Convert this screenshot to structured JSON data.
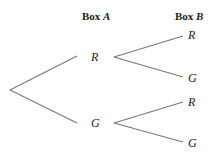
{
  "diagram": {
    "type": "tree",
    "headers": {
      "box_a": {
        "prefix": "Box",
        "var": "A"
      },
      "box_b": {
        "prefix": "Box",
        "var": "B"
      }
    },
    "level1": [
      {
        "label": "R",
        "children": [
          "R",
          "G"
        ]
      },
      {
        "label": "G",
        "children": [
          "R",
          "G"
        ]
      }
    ],
    "colors": {
      "line": "#777777",
      "text": "#222222",
      "background": "#ffffff"
    }
  }
}
